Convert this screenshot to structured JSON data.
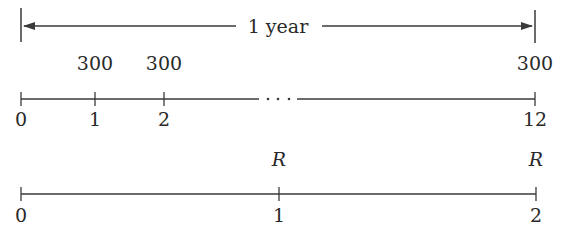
{
  "top_span": {
    "label": "1 year",
    "start_x": 21,
    "end_x": 535
  },
  "monthly_timeline": {
    "payments": [
      {
        "period": "1",
        "amount": "300"
      },
      {
        "period": "2",
        "amount": "300"
      },
      {
        "period": "12",
        "amount": "300"
      }
    ],
    "tick_labels": [
      "0",
      "1",
      "2",
      "12"
    ],
    "ellipsis": "· · ·"
  },
  "yearly_timeline": {
    "payments": [
      {
        "period": "1",
        "amount": "R"
      },
      {
        "period": "2",
        "amount": "R"
      }
    ],
    "tick_labels": [
      "0",
      "1",
      "2"
    ]
  },
  "colors": {
    "line": "#3a3a3a",
    "text": "#2a2a2a",
    "background": "#ffffff"
  }
}
